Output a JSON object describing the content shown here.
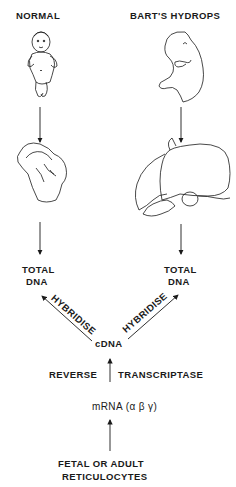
{
  "columns": {
    "left": {
      "title": "NORMAL",
      "subject_icon": "newborn-baby-icon",
      "organ_icon": "normal-liver-icon",
      "result_line1": "TOTAL",
      "result_line2": "DNA"
    },
    "right": {
      "title": "BART'S  HYDROPS",
      "subject_icon": "hydropic-fetus-icon",
      "organ_icon": "enlarged-liver-icon",
      "result_line1": "TOTAL",
      "result_line2": "DNA"
    }
  },
  "hybridise": {
    "left_label": "HYBRIDISE",
    "right_label": "HYBRIDISE"
  },
  "center": {
    "probe": "cDNA",
    "step_left": "REVERSE",
    "step_right": "TRANSCRIPTASE",
    "mrna": "mRNA (α β γ)",
    "source_line1": "FETAL  OR  ADULT",
    "source_line2": "RETICULOCYTES"
  },
  "colors": {
    "ink": "#1a1a1a",
    "background": "#ffffff"
  }
}
